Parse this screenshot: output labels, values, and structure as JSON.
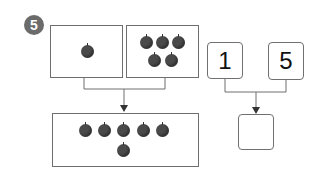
{
  "problem": {
    "number": "5",
    "left_group": {
      "box1_apples": 1,
      "box2_apples": 5,
      "result_apples": 6
    },
    "right_group": {
      "num1": "1",
      "num2": "5",
      "answer": ""
    }
  },
  "colors": {
    "badge": "#6b6b6b",
    "apple": "#4a4a4a",
    "line": "#6e6e6e"
  }
}
